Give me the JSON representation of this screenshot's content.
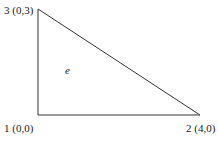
{
  "diagram": {
    "type": "triangular finite element",
    "element_label": "e",
    "nodes": [
      {
        "id": "1",
        "coords": "(0,0)",
        "label": "1 (0,0)",
        "x": 0,
        "y": 0
      },
      {
        "id": "2",
        "coords": "(4,0)",
        "label": "2 (4,0)",
        "x": 4,
        "y": 0
      },
      {
        "id": "3",
        "coords": "(0,3)",
        "label": "3 (0,3)",
        "x": 0,
        "y": 3
      }
    ],
    "edges": [
      {
        "from": "1",
        "to": "2"
      },
      {
        "from": "2",
        "to": "3"
      },
      {
        "from": "3",
        "to": "1"
      }
    ],
    "colors": {
      "line": "#333333",
      "text": "#222222",
      "background": "#ffffff"
    }
  }
}
